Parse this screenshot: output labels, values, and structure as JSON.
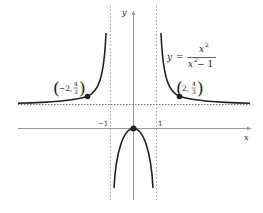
{
  "figure": {
    "type": "function-graph",
    "equation": {
      "lhs": "y",
      "equals": "=",
      "numerator": "x",
      "numerator_exp": "2",
      "denominator": "x",
      "denominator_exp": "2",
      "denominator_rest": " − 1"
    },
    "axes": {
      "x_label": "x",
      "y_label": "y",
      "tick_neg1": "−1",
      "tick_pos1": "1"
    },
    "asymptotes": {
      "vertical": [
        -1,
        1
      ],
      "horizontal": [
        1
      ]
    },
    "points": [
      {
        "name": "left-point",
        "x": -2,
        "y_num": "4",
        "y_den": "3",
        "label_prefix": "−2,",
        "open": "(",
        "close": ")"
      },
      {
        "name": "right-point",
        "x": 2,
        "y_num": "4",
        "y_den": "3",
        "label_prefix": "2,",
        "open": "(",
        "close": ")"
      },
      {
        "name": "origin-point",
        "x": 0,
        "y": 0
      }
    ],
    "colors": {
      "curve": "#222222",
      "axis": "#888888",
      "asymptote": "#777777"
    }
  }
}
